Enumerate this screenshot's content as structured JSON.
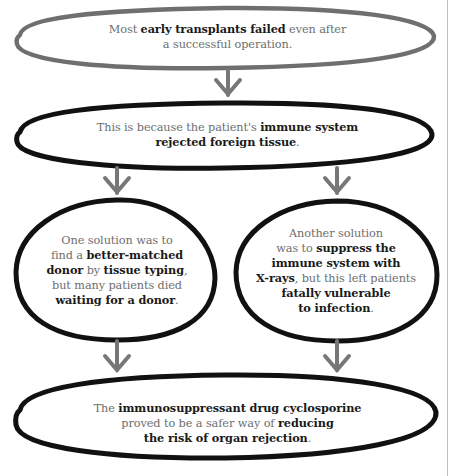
{
  "diagram": {
    "colors": {
      "background": "#ffffff",
      "first_outline": "#6f6f6f",
      "outline": "#111111",
      "arrow": "#777777",
      "regular_text": "#6e6e6e",
      "bold_text": "#1a1a1a",
      "divider": "#bdbdbd"
    },
    "nodes": [
      {
        "id": "early-transplants",
        "shape": "ellipse",
        "lines": [
          {
            "parts": [
              {
                "t": "Most ",
                "b": false
              },
              {
                "t": "early transplants failed",
                "b": true
              },
              {
                "t": " even after",
                "b": false
              }
            ]
          },
          {
            "parts": [
              {
                "t": "a successful operation.",
                "b": false
              }
            ]
          }
        ]
      },
      {
        "id": "immune-rejection",
        "shape": "ellipse",
        "lines": [
          {
            "parts": [
              {
                "t": "This is because the patient's ",
                "b": false
              },
              {
                "t": "immune system",
                "b": true
              }
            ]
          },
          {
            "parts": [
              {
                "t": "rejected foreign tissue",
                "b": true
              },
              {
                "t": ".",
                "b": false
              }
            ]
          }
        ]
      },
      {
        "id": "tissue-typing",
        "shape": "circle",
        "lines": [
          {
            "parts": [
              {
                "t": "One solution was to",
                "b": false
              }
            ]
          },
          {
            "parts": [
              {
                "t": "find a ",
                "b": false
              },
              {
                "t": "better-matched",
                "b": true
              }
            ]
          },
          {
            "parts": [
              {
                "t": "donor",
                "b": true
              },
              {
                "t": " by ",
                "b": false
              },
              {
                "t": "tissue typing",
                "b": true
              },
              {
                "t": ",",
                "b": false
              }
            ]
          },
          {
            "parts": [
              {
                "t": "but many patients died",
                "b": false
              }
            ]
          },
          {
            "parts": [
              {
                "t": "waiting for a donor",
                "b": true
              },
              {
                "t": ".",
                "b": false
              }
            ]
          }
        ]
      },
      {
        "id": "x-ray-suppression",
        "shape": "circle",
        "lines": [
          {
            "parts": [
              {
                "t": "Another solution",
                "b": false
              }
            ]
          },
          {
            "parts": [
              {
                "t": "was to ",
                "b": false
              },
              {
                "t": "suppress the",
                "b": true
              }
            ]
          },
          {
            "parts": [
              {
                "t": "immune system with",
                "b": true
              }
            ]
          },
          {
            "parts": [
              {
                "t": "X-rays",
                "b": true
              },
              {
                "t": ", but this left patients",
                "b": false
              }
            ]
          },
          {
            "parts": [
              {
                "t": "fatally vulnerable",
                "b": true
              }
            ]
          },
          {
            "parts": [
              {
                "t": "to infection",
                "b": true
              },
              {
                "t": ".",
                "b": false
              }
            ]
          }
        ]
      },
      {
        "id": "cyclosporine",
        "shape": "ellipse",
        "lines": [
          {
            "parts": [
              {
                "t": "The ",
                "b": false
              },
              {
                "t": "immunosuppressant drug cyclosporine",
                "b": true
              }
            ]
          },
          {
            "parts": [
              {
                "t": "proved to be a safer way of ",
                "b": false
              },
              {
                "t": "reducing",
                "b": true
              }
            ]
          },
          {
            "parts": [
              {
                "t": "the risk of organ rejection",
                "b": true
              },
              {
                "t": ".",
                "b": false
              }
            ]
          }
        ]
      }
    ],
    "edges": [
      {
        "from": "early-transplants",
        "to": "immune-rejection",
        "icon": "arrow-down-icon"
      },
      {
        "from": "immune-rejection",
        "to": "tissue-typing",
        "icon": "arrow-down-icon"
      },
      {
        "from": "immune-rejection",
        "to": "x-ray-suppression",
        "icon": "arrow-down-icon"
      },
      {
        "from": "tissue-typing",
        "to": "cyclosporine",
        "icon": "arrow-down-icon"
      },
      {
        "from": "x-ray-suppression",
        "to": "cyclosporine",
        "icon": "arrow-down-icon"
      }
    ]
  }
}
